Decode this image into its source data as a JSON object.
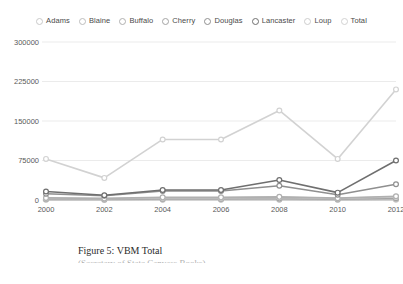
{
  "figure": {
    "caption_line1": "Figure 5: VBM Total",
    "caption_line2": "(Secretary of State Canvass Books)"
  },
  "legend": {
    "position": "top-center",
    "items": [
      {
        "label": "Adams",
        "color": "#c9c9c9",
        "marker": "circle-open"
      },
      {
        "label": "Blaine",
        "color": "#bdbdbd",
        "marker": "circle-open"
      },
      {
        "label": "Buffalo",
        "color": "#b0b0b0",
        "marker": "circle-open"
      },
      {
        "label": "Cherry",
        "color": "#a3a3a3",
        "marker": "circle-open"
      },
      {
        "label": "Douglas",
        "color": "#8f8f8f",
        "marker": "circle-open"
      },
      {
        "label": "Lancaster",
        "color": "#6f6f6f",
        "marker": "circle-open"
      },
      {
        "label": "Loup",
        "color": "#cdcdcd",
        "marker": "circle-open"
      },
      {
        "label": "Total",
        "color": "#d2d2d2",
        "marker": "circle-open"
      }
    ]
  },
  "chart_data": {
    "type": "line",
    "title": "Figure 5: VBM Total",
    "subtitle": "(Secretary of State Canvass Books)",
    "xlabel": "",
    "ylabel": "",
    "x": [
      2000,
      2002,
      2004,
      2006,
      2008,
      2010,
      2012
    ],
    "categories": [
      "2000",
      "2002",
      "2004",
      "2006",
      "2008",
      "2010",
      "2012"
    ],
    "xlim": [
      2000,
      2012
    ],
    "ylim": [
      0,
      300000
    ],
    "yticks": [
      0,
      75000,
      150000,
      225000,
      300000
    ],
    "ytick_labels": [
      "0",
      "75000",
      "150000",
      "225000",
      "300000"
    ],
    "xticks": [
      2000,
      2002,
      2004,
      2006,
      2008,
      2010,
      2012
    ],
    "xtick_labels": [
      "2000",
      "2002",
      "2004",
      "2006",
      "2008",
      "2010",
      "2012"
    ],
    "grid": true,
    "legend_position": "top",
    "series": [
      {
        "name": "Adams",
        "color": "#c9c9c9",
        "values": [
          3000,
          2500,
          4000,
          4000,
          5000,
          3000,
          6000
        ]
      },
      {
        "name": "Blaine",
        "color": "#bdbdbd",
        "values": [
          800,
          600,
          900,
          900,
          1100,
          700,
          1200
        ]
      },
      {
        "name": "Buffalo",
        "color": "#b0b0b0",
        "values": [
          4000,
          3000,
          5000,
          5000,
          6000,
          3500,
          7000
        ]
      },
      {
        "name": "Cherry",
        "color": "#a3a3a3",
        "values": [
          2000,
          1500,
          2500,
          2500,
          3000,
          1800,
          3500
        ]
      },
      {
        "name": "Douglas",
        "color": "#8f8f8f",
        "values": [
          12000,
          8000,
          17000,
          17000,
          27000,
          10000,
          30000
        ]
      },
      {
        "name": "Lancaster",
        "color": "#6f6f6f",
        "values": [
          16000,
          9000,
          19000,
          19000,
          38000,
          14000,
          75000
        ]
      },
      {
        "name": "Loup",
        "color": "#cdcdcd",
        "values": [
          300,
          200,
          400,
          400,
          500,
          300,
          600
        ]
      },
      {
        "name": "Total",
        "color": "#d2d2d2",
        "values": [
          78000,
          42000,
          115000,
          115000,
          170000,
          78000,
          210000
        ]
      }
    ]
  }
}
